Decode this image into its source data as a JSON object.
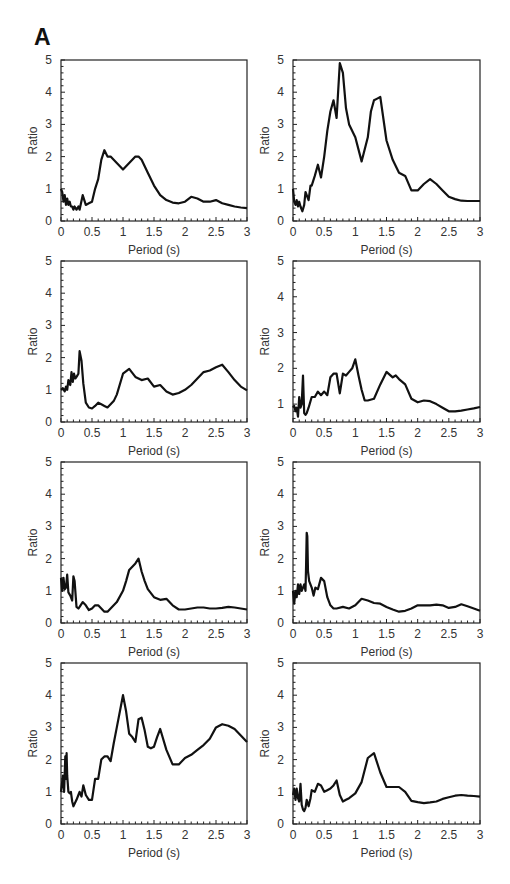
{
  "figure": {
    "panel_label": "A"
  },
  "chart_data": [
    {
      "type": "line",
      "title": "",
      "xlabel": "Period (s)",
      "ylabel": "Ratio",
      "xlim": [
        0,
        3
      ],
      "ylim": [
        0,
        5
      ],
      "grid": false,
      "legend": null,
      "xticks": [
        "0",
        "0.5",
        "1",
        "1.5",
        "2",
        "2.5",
        "3"
      ],
      "yticks": [
        "0",
        "1",
        "2",
        "3",
        "4",
        "5"
      ],
      "series": [
        {
          "name": "ratio",
          "x": [
            0,
            0.02,
            0.04,
            0.06,
            0.08,
            0.1,
            0.12,
            0.14,
            0.16,
            0.18,
            0.2,
            0.22,
            0.25,
            0.28,
            0.3,
            0.35,
            0.4,
            0.45,
            0.5,
            0.55,
            0.6,
            0.65,
            0.7,
            0.75,
            0.8,
            0.85,
            0.9,
            1.0,
            1.1,
            1.2,
            1.25,
            1.3,
            1.4,
            1.5,
            1.6,
            1.7,
            1.8,
            1.9,
            2.0,
            2.1,
            2.2,
            2.3,
            2.4,
            2.5,
            2.6,
            2.7,
            2.8,
            2.9,
            3.0
          ],
          "y": [
            1.0,
            0.9,
            0.6,
            0.8,
            0.5,
            0.7,
            0.5,
            0.6,
            0.45,
            0.45,
            0.35,
            0.45,
            0.35,
            0.45,
            0.35,
            0.8,
            0.5,
            0.55,
            0.6,
            1.0,
            1.3,
            1.9,
            2.2,
            2.0,
            2.0,
            1.9,
            1.8,
            1.6,
            1.8,
            2.0,
            2.0,
            1.9,
            1.5,
            1.1,
            0.8,
            0.65,
            0.57,
            0.55,
            0.6,
            0.75,
            0.7,
            0.6,
            0.6,
            0.65,
            0.55,
            0.5,
            0.45,
            0.42,
            0.4
          ]
        }
      ]
    },
    {
      "type": "line",
      "title": "",
      "xlabel": "Period (s)",
      "ylabel": "Ratio",
      "xlim": [
        0,
        3
      ],
      "ylim": [
        0,
        5
      ],
      "grid": false,
      "legend": null,
      "xticks": [
        "0",
        "0.5",
        "1",
        "1.5",
        "2",
        "2.5",
        "3"
      ],
      "yticks": [
        "0",
        "1",
        "2",
        "3",
        "4",
        "5"
      ],
      "series": [
        {
          "name": "ratio",
          "x": [
            0,
            0.02,
            0.04,
            0.06,
            0.08,
            0.1,
            0.12,
            0.15,
            0.18,
            0.2,
            0.25,
            0.28,
            0.3,
            0.35,
            0.4,
            0.45,
            0.5,
            0.55,
            0.6,
            0.65,
            0.7,
            0.75,
            0.8,
            0.85,
            0.9,
            1.0,
            1.1,
            1.2,
            1.25,
            1.3,
            1.35,
            1.4,
            1.5,
            1.6,
            1.7,
            1.8,
            1.9,
            2.0,
            2.1,
            2.2,
            2.3,
            2.4,
            2.5,
            2.6,
            2.7,
            2.8,
            2.9,
            3.0
          ],
          "y": [
            1.0,
            0.6,
            0.5,
            0.65,
            0.45,
            0.6,
            0.45,
            0.3,
            0.5,
            0.9,
            0.65,
            1.1,
            1.1,
            1.4,
            1.75,
            1.35,
            2.0,
            2.8,
            3.4,
            3.75,
            3.2,
            4.9,
            4.6,
            3.5,
            3.0,
            2.6,
            1.85,
            2.6,
            3.4,
            3.75,
            3.8,
            3.85,
            2.5,
            1.9,
            1.5,
            1.4,
            0.95,
            0.95,
            1.15,
            1.3,
            1.15,
            0.95,
            0.75,
            0.68,
            0.63,
            0.62,
            0.62,
            0.62
          ]
        }
      ]
    },
    {
      "type": "line",
      "title": "",
      "xlabel": "Period (s)",
      "ylabel": "Ratio",
      "xlim": [
        0,
        3
      ],
      "ylim": [
        0,
        5
      ],
      "grid": false,
      "legend": null,
      "xticks": [
        "0",
        "0.5",
        "1",
        "1.5",
        "2",
        "2.5",
        "3"
      ],
      "yticks": [
        "0",
        "1",
        "2",
        "3",
        "4",
        "5"
      ],
      "series": [
        {
          "name": "ratio",
          "x": [
            0,
            0.03,
            0.06,
            0.08,
            0.1,
            0.12,
            0.15,
            0.17,
            0.19,
            0.21,
            0.23,
            0.25,
            0.28,
            0.3,
            0.33,
            0.36,
            0.4,
            0.45,
            0.5,
            0.55,
            0.6,
            0.65,
            0.7,
            0.75,
            0.8,
            0.85,
            0.9,
            1.0,
            1.1,
            1.2,
            1.3,
            1.4,
            1.5,
            1.6,
            1.7,
            1.8,
            1.9,
            2.0,
            2.1,
            2.2,
            2.3,
            2.4,
            2.5,
            2.6,
            2.7,
            2.8,
            2.9,
            3.0
          ],
          "y": [
            1.0,
            1.05,
            0.95,
            1.1,
            1.0,
            1.3,
            1.15,
            1.55,
            1.25,
            1.5,
            1.35,
            1.4,
            1.5,
            2.2,
            1.9,
            1.2,
            0.6,
            0.45,
            0.42,
            0.5,
            0.6,
            0.55,
            0.5,
            0.45,
            0.55,
            0.65,
            0.85,
            1.5,
            1.65,
            1.4,
            1.3,
            1.35,
            1.1,
            1.15,
            0.95,
            0.85,
            0.9,
            1.0,
            1.15,
            1.35,
            1.55,
            1.6,
            1.7,
            1.78,
            1.55,
            1.3,
            1.1,
            0.98
          ]
        }
      ]
    },
    {
      "type": "line",
      "title": "",
      "xlabel": "Period (s)",
      "ylabel": "Ratio",
      "xlim": [
        0,
        3
      ],
      "ylim": [
        0.5,
        5
      ],
      "grid": false,
      "legend": null,
      "xticks": [
        "0",
        "0.5",
        "1",
        "1.5",
        "2",
        "2.5",
        "3"
      ],
      "yticks": [
        "1",
        "2",
        "3",
        "4",
        "5"
      ],
      "series": [
        {
          "name": "ratio",
          "x": [
            0,
            0.02,
            0.04,
            0.06,
            0.08,
            0.1,
            0.12,
            0.14,
            0.16,
            0.18,
            0.2,
            0.22,
            0.25,
            0.3,
            0.35,
            0.4,
            0.45,
            0.5,
            0.55,
            0.6,
            0.65,
            0.7,
            0.75,
            0.8,
            0.85,
            0.9,
            0.95,
            1.0,
            1.05,
            1.1,
            1.15,
            1.2,
            1.3,
            1.4,
            1.5,
            1.6,
            1.65,
            1.7,
            1.8,
            1.9,
            2.0,
            2.1,
            2.2,
            2.3,
            2.4,
            2.5,
            2.6,
            2.7,
            2.8,
            2.9,
            3.0
          ],
          "y": [
            0.9,
            0.95,
            0.8,
            0.9,
            0.65,
            1.2,
            0.9,
            1.0,
            1.8,
            0.75,
            0.7,
            0.75,
            0.9,
            1.2,
            1.2,
            1.35,
            1.25,
            1.35,
            1.25,
            1.75,
            1.85,
            1.85,
            1.3,
            1.85,
            1.8,
            1.9,
            2.0,
            2.25,
            1.8,
            1.4,
            1.1,
            1.1,
            1.15,
            1.55,
            1.9,
            1.75,
            1.8,
            1.7,
            1.55,
            1.15,
            1.05,
            1.1,
            1.08,
            1.0,
            0.9,
            0.8,
            0.8,
            0.82,
            0.85,
            0.88,
            0.92
          ]
        }
      ]
    },
    {
      "type": "line",
      "title": "",
      "xlabel": "Period (s)",
      "ylabel": "Ratio",
      "xlim": [
        0,
        3
      ],
      "ylim": [
        0,
        5
      ],
      "grid": false,
      "legend": null,
      "xticks": [
        "0",
        "0.5",
        "1",
        "1.5",
        "2",
        "2.5",
        "3"
      ],
      "yticks": [
        "0",
        "1",
        "2",
        "3",
        "4",
        "5"
      ],
      "series": [
        {
          "name": "ratio",
          "x": [
            0,
            0.02,
            0.04,
            0.06,
            0.08,
            0.1,
            0.12,
            0.15,
            0.18,
            0.2,
            0.22,
            0.25,
            0.28,
            0.3,
            0.35,
            0.4,
            0.45,
            0.5,
            0.55,
            0.6,
            0.65,
            0.7,
            0.75,
            0.8,
            0.85,
            0.9,
            1.0,
            1.05,
            1.1,
            1.15,
            1.2,
            1.25,
            1.3,
            1.35,
            1.4,
            1.5,
            1.6,
            1.7,
            1.8,
            1.9,
            2.0,
            2.1,
            2.2,
            2.3,
            2.4,
            2.5,
            2.6,
            2.7,
            2.8,
            2.9,
            3.0
          ],
          "y": [
            1.4,
            1.0,
            1.4,
            1.05,
            1.1,
            1.5,
            0.95,
            0.85,
            0.7,
            1.45,
            1.3,
            0.5,
            0.45,
            0.5,
            0.65,
            0.55,
            0.4,
            0.45,
            0.55,
            0.55,
            0.45,
            0.35,
            0.35,
            0.45,
            0.55,
            0.65,
            1.0,
            1.3,
            1.65,
            1.75,
            1.85,
            2.0,
            1.6,
            1.3,
            1.05,
            0.8,
            0.72,
            0.75,
            0.55,
            0.42,
            0.42,
            0.45,
            0.48,
            0.48,
            0.45,
            0.45,
            0.47,
            0.5,
            0.48,
            0.45,
            0.42
          ]
        }
      ]
    },
    {
      "type": "line",
      "title": "",
      "xlabel": "Period (s)",
      "ylabel": "Ratio",
      "xlim": [
        0,
        3
      ],
      "ylim": [
        0,
        5
      ],
      "grid": false,
      "legend": null,
      "xticks": [
        "0",
        "0.5",
        "1",
        "1.5",
        "2",
        "2.5",
        "3"
      ],
      "yticks": [
        "0",
        "1",
        "2",
        "3",
        "4",
        "5"
      ],
      "series": [
        {
          "name": "ratio",
          "x": [
            0,
            0.02,
            0.04,
            0.06,
            0.08,
            0.1,
            0.12,
            0.14,
            0.16,
            0.18,
            0.2,
            0.21,
            0.22,
            0.23,
            0.24,
            0.26,
            0.3,
            0.33,
            0.36,
            0.4,
            0.45,
            0.5,
            0.55,
            0.6,
            0.65,
            0.7,
            0.8,
            0.9,
            1.0,
            1.1,
            1.2,
            1.3,
            1.4,
            1.5,
            1.6,
            1.7,
            1.8,
            1.9,
            2.0,
            2.1,
            2.2,
            2.3,
            2.4,
            2.5,
            2.6,
            2.7,
            2.8,
            2.9,
            3.0
          ],
          "y": [
            1.0,
            0.6,
            1.0,
            0.8,
            1.2,
            0.9,
            1.2,
            1.0,
            1.1,
            1.2,
            1.0,
            1.8,
            2.8,
            2.7,
            1.6,
            1.3,
            1.1,
            0.85,
            1.1,
            1.05,
            1.4,
            1.3,
            0.8,
            0.55,
            0.45,
            0.45,
            0.5,
            0.45,
            0.55,
            0.75,
            0.7,
            0.62,
            0.6,
            0.5,
            0.42,
            0.35,
            0.38,
            0.45,
            0.55,
            0.55,
            0.55,
            0.57,
            0.55,
            0.47,
            0.5,
            0.58,
            0.52,
            0.45,
            0.38
          ]
        }
      ]
    },
    {
      "type": "line",
      "title": "",
      "xlabel": "Period (s)",
      "ylabel": "Ratio",
      "xlim": [
        0,
        3
      ],
      "ylim": [
        0,
        5
      ],
      "grid": false,
      "legend": null,
      "xticks": [
        "0",
        "0.5",
        "1",
        "1.5",
        "2",
        "2.5",
        "3"
      ],
      "yticks": [
        "0",
        "1",
        "2",
        "3",
        "4",
        "5"
      ],
      "series": [
        {
          "name": "ratio",
          "x": [
            0,
            0.03,
            0.05,
            0.07,
            0.08,
            0.09,
            0.1,
            0.12,
            0.14,
            0.16,
            0.18,
            0.2,
            0.25,
            0.28,
            0.3,
            0.33,
            0.36,
            0.4,
            0.45,
            0.5,
            0.55,
            0.6,
            0.65,
            0.7,
            0.75,
            0.8,
            0.85,
            0.9,
            1.0,
            1.05,
            1.1,
            1.15,
            1.2,
            1.25,
            1.3,
            1.35,
            1.4,
            1.45,
            1.5,
            1.55,
            1.6,
            1.7,
            1.8,
            1.9,
            2.0,
            2.1,
            2.2,
            2.3,
            2.4,
            2.5,
            2.6,
            2.7,
            2.8,
            2.9,
            3.0
          ],
          "y": [
            1.0,
            1.5,
            1.0,
            2.1,
            1.4,
            2.2,
            1.5,
            1.0,
            0.95,
            1.0,
            0.7,
            0.55,
            0.75,
            0.9,
            1.0,
            0.85,
            1.2,
            0.9,
            0.75,
            0.75,
            1.4,
            1.4,
            2.0,
            2.1,
            2.1,
            1.95,
            2.5,
            3.0,
            4.0,
            3.5,
            2.8,
            2.7,
            2.55,
            3.25,
            3.3,
            2.9,
            2.4,
            2.35,
            2.4,
            2.7,
            2.95,
            2.3,
            1.85,
            1.85,
            2.05,
            2.15,
            2.3,
            2.45,
            2.65,
            3.0,
            3.1,
            3.05,
            2.95,
            2.75,
            2.55
          ]
        }
      ]
    },
    {
      "type": "line",
      "title": "",
      "xlabel": "Period (s)",
      "ylabel": "Ratio",
      "xlim": [
        0,
        3
      ],
      "ylim": [
        0,
        5
      ],
      "grid": false,
      "legend": null,
      "xticks": [
        "0",
        "0.5",
        "1",
        "1.5",
        "2",
        "2.5",
        "3"
      ],
      "yticks": [
        "0",
        "1",
        "2",
        "3",
        "4",
        "5"
      ],
      "series": [
        {
          "name": "ratio",
          "x": [
            0,
            0.02,
            0.04,
            0.06,
            0.08,
            0.1,
            0.12,
            0.14,
            0.16,
            0.18,
            0.2,
            0.22,
            0.25,
            0.28,
            0.3,
            0.35,
            0.4,
            0.45,
            0.5,
            0.55,
            0.6,
            0.65,
            0.7,
            0.75,
            0.8,
            0.85,
            0.9,
            1.0,
            1.1,
            1.2,
            1.3,
            1.4,
            1.5,
            1.6,
            1.7,
            1.8,
            1.9,
            2.0,
            2.1,
            2.2,
            2.3,
            2.4,
            2.5,
            2.6,
            2.7,
            2.8,
            2.9,
            3.0
          ],
          "y": [
            0.9,
            1.1,
            0.75,
            1.1,
            0.8,
            0.7,
            1.25,
            0.6,
            0.45,
            0.4,
            0.5,
            0.75,
            0.55,
            0.8,
            1.05,
            1.0,
            1.25,
            1.2,
            1.0,
            1.05,
            1.1,
            1.2,
            1.35,
            0.9,
            0.7,
            0.75,
            0.8,
            0.95,
            1.3,
            2.05,
            2.2,
            1.6,
            1.15,
            1.15,
            1.15,
            1.0,
            0.72,
            0.68,
            0.65,
            0.67,
            0.7,
            0.78,
            0.83,
            0.88,
            0.9,
            0.88,
            0.87,
            0.85
          ]
        }
      ]
    }
  ]
}
